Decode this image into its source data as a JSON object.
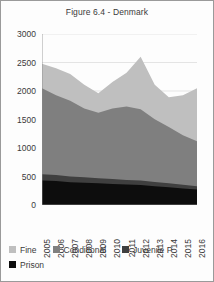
{
  "figure": {
    "title": "Figure 6.4 - Denmark",
    "border_color": "#9a9a9a",
    "background": "#fdfdfd"
  },
  "chart_data": {
    "type": "area",
    "stacked": true,
    "title": "Figure 6.4 - Denmark",
    "xlabel": "",
    "ylabel": "",
    "categories": [
      "2005",
      "2006",
      "2007",
      "2008",
      "2009",
      "2010",
      "2011",
      "2012",
      "2013",
      "2014",
      "2015",
      "2016"
    ],
    "x": [
      2005,
      2006,
      2007,
      2008,
      2009,
      2010,
      2011,
      2012,
      2013,
      2014,
      2015,
      2016
    ],
    "ylim": [
      0,
      3000
    ],
    "yticks": [
      0,
      500,
      1000,
      1500,
      2000,
      2500,
      3000
    ],
    "ytick_labels": [
      "0",
      "500",
      "1000",
      "1500",
      "2000",
      "2500",
      "3000"
    ],
    "grid": true,
    "grid_axis": "y",
    "legend_position": "bottom",
    "series": [
      {
        "name": "Prison",
        "color": "#0d0d0d",
        "stack_order": 1,
        "values": [
          430,
          420,
          400,
          390,
          380,
          370,
          360,
          350,
          330,
          310,
          290,
          270
        ]
      },
      {
        "name": "Juvenile P",
        "color": "#3f3f3f",
        "stack_order": 2,
        "values": [
          110,
          105,
          100,
          95,
          90,
          85,
          80,
          80,
          75,
          70,
          65,
          60
        ]
      },
      {
        "name": "Conditional",
        "color": "#7f7f7f",
        "stack_order": 3,
        "values": [
          1510,
          1400,
          1330,
          1210,
          1150,
          1240,
          1290,
          1250,
          1100,
          990,
          870,
          790
        ]
      },
      {
        "name": "Fine",
        "color": "#bfbfbf",
        "stack_order": 4,
        "values": [
          430,
          475,
          470,
          415,
          340,
          465,
          590,
          920,
          605,
          520,
          700,
          930
        ]
      }
    ],
    "totals": [
      2480,
      2400,
      2300,
      2110,
      1960,
      2160,
      2320,
      2600,
      2110,
      1890,
      1925,
      2050
    ]
  },
  "legend": {
    "row1": [
      {
        "label": "Fine",
        "color": "#bfbfbf"
      },
      {
        "label": "Conditional",
        "color": "#7f7f7f"
      },
      {
        "label": "Juvenile P",
        "color": "#3f3f3f"
      }
    ],
    "row2": [
      {
        "label": "Prison",
        "color": "#0d0d0d"
      }
    ]
  }
}
